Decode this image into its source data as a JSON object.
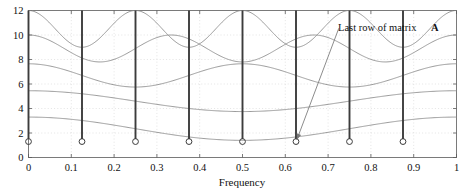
{
  "chart_data": {
    "type": "line",
    "title": "",
    "xlabel": "Frequency",
    "ylabel": "",
    "xlim": [
      0,
      1
    ],
    "ylim": [
      0,
      12
    ],
    "grid": true,
    "legend_position": "none",
    "xticks": [
      0,
      0.1,
      0.2,
      0.3,
      0.4,
      0.5,
      0.6,
      0.7,
      0.8,
      0.9,
      1
    ],
    "xtick_labels": [
      "0",
      "0.1",
      "0.2",
      "0.3",
      "0.4",
      "0.5",
      "0.6",
      "0.7",
      "0.8",
      "0.9",
      "1"
    ],
    "yticks": [
      0,
      2,
      4,
      6,
      8,
      10,
      12
    ],
    "ytick_labels": [
      "0",
      "2",
      "4",
      "6",
      "8",
      "10",
      "12"
    ],
    "series": [
      {
        "name": "curve-1",
        "kind": "line",
        "color": "#8a8a8a",
        "cycles": 4,
        "offset": 10.5,
        "amplitude": 1.5,
        "phase": 0.0,
        "description": "topmost wavy curve oscillating between 9 and 12"
      },
      {
        "name": "curve-2",
        "kind": "line",
        "color": "#8a8a8a",
        "cycles": 3,
        "offset": 8.9,
        "amplitude": 1.1,
        "phase": 0.0,
        "description": "second wavy curve oscillating between 7.8 and 10"
      },
      {
        "name": "curve-3",
        "kind": "line",
        "color": "#8a8a8a",
        "cycles": 2,
        "offset": 6.7,
        "amplitude": 0.95,
        "phase": 0.0,
        "description": "third wavy curve oscillating between 5.7 and 7.6"
      },
      {
        "name": "curve-4",
        "kind": "line",
        "color": "#8a8a8a",
        "cycles": 1,
        "offset": 4.6,
        "amplitude": 0.85,
        "phase": 0.0,
        "description": "fourth gently wavy curve oscillating between 3.7 and 5.5"
      },
      {
        "name": "curve-5",
        "kind": "line",
        "color": "#8a8a8a",
        "cycles": 1,
        "offset": 2.35,
        "amplitude": 0.95,
        "phase": 0.0,
        "description": "lowest nearly flat curve, dipping from 3.3 to 1.3 and back"
      }
    ],
    "stems": {
      "name": "last-row-of-matrix-a",
      "color": "#3c3c3c",
      "marker": "open-circle",
      "marker_color": "#3c3c3c",
      "baseline": 1.3,
      "top": 12,
      "x": [
        0,
        0.125,
        0.25,
        0.375,
        0.5,
        0.625,
        0.75,
        0.875
      ],
      "y": [
        1.3,
        1.3,
        1.3,
        1.3,
        1.3,
        1.3,
        1.3,
        1.3
      ],
      "highlighted_index": 5,
      "description": "eight vertical stem lines with open circle markers spaced every 0.125"
    },
    "annotations": [
      {
        "name": "last-row-annotation",
        "text": "Last row of matrix ",
        "text_bold": "A",
        "text_x": 0.72,
        "text_y": 11.0,
        "arrow_from": [
          0.725,
          10.55
        ],
        "arrow_to": [
          0.627,
          1.45
        ],
        "color": "#777777"
      }
    ]
  },
  "axis": {
    "xlabel": "Frequency",
    "xtick_labels": [
      "0",
      "0.1",
      "0.2",
      "0.3",
      "0.4",
      "0.5",
      "0.6",
      "0.7",
      "0.8",
      "0.9",
      "1"
    ],
    "ytick_labels": [
      "0",
      "2",
      "4",
      "6",
      "8",
      "10",
      "12"
    ]
  },
  "annotation": {
    "label": "Last row of matrix ",
    "matrix_symbol": "A"
  }
}
